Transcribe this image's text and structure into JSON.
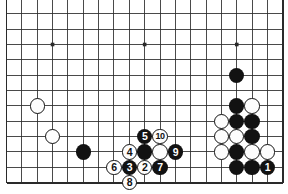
{
  "diagram": {
    "type": "go-board-diagram",
    "board": {
      "columns": 19,
      "rows": 12,
      "visible_region": "top-edge cropped, bottom edge shown",
      "line_color": "#2a2a2a",
      "background_color": "#ffffff",
      "star_points": [
        {
          "col": 3,
          "row": 2
        },
        {
          "col": 9,
          "row": 2
        },
        {
          "col": 15,
          "row": 2
        }
      ],
      "geometry": {
        "origin_x": 6.5,
        "origin_y": 13.8,
        "cell": 15.35,
        "edge_left_col": 0,
        "edge_bottom_row": 11
      }
    },
    "stones": [
      {
        "id": "w-a",
        "color": "white",
        "col": 2,
        "row": 6,
        "label": ""
      },
      {
        "id": "w-b",
        "color": "white",
        "col": 3,
        "row": 8,
        "label": ""
      },
      {
        "id": "b-a",
        "color": "black",
        "col": 5,
        "row": 9,
        "label": ""
      },
      {
        "id": "b-top",
        "color": "black",
        "col": 15,
        "row": 4,
        "label": ""
      },
      {
        "id": "b-r1",
        "color": "black",
        "col": 15,
        "row": 6,
        "label": ""
      },
      {
        "id": "w-r1",
        "color": "white",
        "col": 16,
        "row": 6,
        "label": ""
      },
      {
        "id": "w-r2",
        "color": "white",
        "col": 14,
        "row": 7,
        "label": ""
      },
      {
        "id": "b-r2",
        "color": "black",
        "col": 15,
        "row": 7,
        "label": ""
      },
      {
        "id": "b-r3",
        "color": "black",
        "col": 16,
        "row": 7,
        "label": ""
      },
      {
        "id": "w-r3",
        "color": "white",
        "col": 14,
        "row": 8,
        "label": ""
      },
      {
        "id": "w-r4",
        "color": "white",
        "col": 15,
        "row": 8,
        "label": ""
      },
      {
        "id": "b-r4",
        "color": "black",
        "col": 16,
        "row": 8,
        "label": ""
      },
      {
        "id": "w-r5",
        "color": "white",
        "col": 14,
        "row": 9,
        "label": ""
      },
      {
        "id": "b-r5",
        "color": "black",
        "col": 15,
        "row": 9,
        "label": ""
      },
      {
        "id": "w-r6",
        "color": "white",
        "col": 16,
        "row": 9,
        "label": ""
      },
      {
        "id": "w-r7",
        "color": "white",
        "col": 17,
        "row": 9,
        "label": ""
      },
      {
        "id": "b-r6",
        "color": "black",
        "col": 15,
        "row": 10,
        "label": ""
      },
      {
        "id": "b-r7",
        "color": "black",
        "col": 16,
        "row": 10,
        "label": ""
      },
      {
        "id": "m1",
        "color": "black",
        "col": 17,
        "row": 10,
        "label": "1"
      },
      {
        "id": "m2",
        "color": "white",
        "col": 9,
        "row": 10,
        "label": "2"
      },
      {
        "id": "m3",
        "color": "black",
        "col": 8,
        "row": 10,
        "label": "3"
      },
      {
        "id": "m4",
        "color": "white",
        "col": 8,
        "row": 9,
        "label": "4"
      },
      {
        "id": "m5",
        "color": "black",
        "col": 9,
        "row": 8,
        "label": "5"
      },
      {
        "id": "m6",
        "color": "white",
        "col": 7,
        "row": 10,
        "label": "6"
      },
      {
        "id": "m7",
        "color": "black",
        "col": 10,
        "row": 10,
        "label": "7"
      },
      {
        "id": "m8",
        "color": "white",
        "col": 8,
        "row": 11,
        "label": "8"
      },
      {
        "id": "m9",
        "color": "black",
        "col": 11,
        "row": 9,
        "label": "9"
      },
      {
        "id": "m10",
        "color": "white",
        "col": 10,
        "row": 8,
        "label": "10"
      },
      {
        "id": "b-c1",
        "color": "black",
        "col": 9,
        "row": 9,
        "label": ""
      },
      {
        "id": "w-c1",
        "color": "white",
        "col": 10,
        "row": 9,
        "label": ""
      }
    ]
  }
}
